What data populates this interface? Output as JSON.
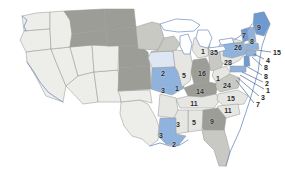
{
  "map": {
    "title": "United States choropleth map with state value labels",
    "figure_width": 285,
    "figure_height": 183,
    "background_color": "#ffffff",
    "border_color": "#9a9a9a",
    "coastline_color": "#6e8fc0",
    "leader_line_color": "#2f4f80",
    "legend_visible": false,
    "palette": {
      "no_data": "#ededea",
      "light_gray": "#e6e6e2",
      "mid_gray": "#c9c9c4",
      "dark_gray": "#9d9d97",
      "pale_blue": "#dde6f2",
      "light_blue": "#bdd1e8",
      "medium_blue": "#8fb3dc",
      "strong_blue": "#6e9ad2",
      "lake_fill": "#ffffff"
    },
    "labels": [
      {
        "id": "label-nd",
        "text": "",
        "x": 131,
        "y": 36,
        "fill": "dark_gray"
      },
      {
        "id": "label-ia",
        "text": "2",
        "x": 163,
        "y": 73,
        "fill": "pale_blue"
      },
      {
        "id": "label-il",
        "text": "5",
        "x": 184,
        "y": 75,
        "fill": "light_gray"
      },
      {
        "id": "label-in",
        "text": "16",
        "x": 202,
        "y": 73,
        "fill": "dark_gray"
      },
      {
        "id": "label-ne",
        "text": "3",
        "x": 163,
        "y": 90,
        "fill": "dark_gray"
      },
      {
        "id": "label-mo",
        "text": "1",
        "x": 177,
        "y": 88,
        "fill": "medium_blue"
      },
      {
        "id": "label-ky",
        "text": "14",
        "x": 200,
        "y": 91,
        "fill": "dark_gray"
      },
      {
        "id": "label-tn",
        "text": "11",
        "x": 194,
        "y": 103,
        "fill": "light_gray"
      },
      {
        "id": "label-mi",
        "text": "1",
        "x": 203,
        "y": 51,
        "fill": "light_gray"
      },
      {
        "id": "label-oh",
        "text": "35",
        "x": 214,
        "y": 52,
        "fill": "mid_gray"
      },
      {
        "id": "label-pa",
        "text": "26",
        "x": 238,
        "y": 47,
        "fill": "medium_blue"
      },
      {
        "id": "label-ny",
        "text": "28",
        "x": 228,
        "y": 62,
        "fill": "light_gray"
      },
      {
        "id": "label-wv",
        "text": "1",
        "x": 218,
        "y": 78,
        "fill": "light_gray"
      },
      {
        "id": "label-va",
        "text": "24",
        "x": 227,
        "y": 85,
        "fill": "mid_gray"
      },
      {
        "id": "label-nc",
        "text": "15",
        "x": 231,
        "y": 98,
        "fill": "light_gray"
      },
      {
        "id": "label-sc",
        "text": "11",
        "x": 228,
        "y": 110,
        "fill": "light_gray"
      },
      {
        "id": "label-ga",
        "text": "9",
        "x": 212,
        "y": 121,
        "fill": "dark_gray"
      },
      {
        "id": "label-al",
        "text": "5",
        "x": 194,
        "y": 122,
        "fill": "light_gray"
      },
      {
        "id": "label-ms",
        "text": "3",
        "x": 178,
        "y": 124,
        "fill": "light_gray"
      },
      {
        "id": "label-tx",
        "text": "3",
        "x": 161,
        "y": 135,
        "fill": "light_gray"
      },
      {
        "id": "label-la",
        "text": "2",
        "x": 174,
        "y": 144,
        "fill": "medium_blue"
      },
      {
        "id": "label-vt",
        "text": "7",
        "x": 244,
        "y": 35,
        "fill": "strong_blue"
      },
      {
        "id": "label-nh",
        "text": "8",
        "x": 252,
        "y": 41,
        "fill": "medium_blue"
      },
      {
        "id": "label-me",
        "text": "9",
        "x": 259,
        "y": 27,
        "fill": "strong_blue"
      }
    ],
    "callouts": [
      {
        "id": "callout-ma",
        "text": "15",
        "x": 277,
        "y": 52,
        "anchor_x": 256,
        "anchor_y": 50
      },
      {
        "id": "callout-ri",
        "text": "4",
        "x": 268,
        "y": 60,
        "anchor_x": 254,
        "anchor_y": 54
      },
      {
        "id": "callout-ct",
        "text": "8",
        "x": 266,
        "y": 67,
        "anchor_x": 252,
        "anchor_y": 57
      },
      {
        "id": "callout-nj",
        "text": "8",
        "x": 266,
        "y": 76,
        "anchor_x": 246,
        "anchor_y": 66
      },
      {
        "id": "callout-de",
        "text": "2",
        "x": 267,
        "y": 83,
        "anchor_x": 242,
        "anchor_y": 72
      },
      {
        "id": "callout-md",
        "text": "1",
        "x": 268,
        "y": 90,
        "anchor_x": 240,
        "anchor_y": 75
      },
      {
        "id": "callout-dc",
        "text": "3",
        "x": 263,
        "y": 97,
        "anchor_x": 238,
        "anchor_y": 78
      },
      {
        "id": "callout-va2",
        "text": "7",
        "x": 258,
        "y": 104,
        "anchor_x": 236,
        "anchor_y": 80
      }
    ]
  }
}
